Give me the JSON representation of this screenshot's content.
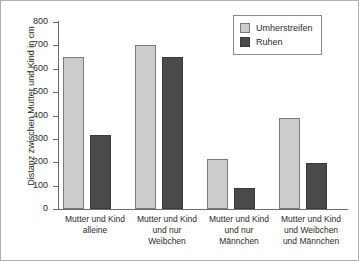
{
  "chart_data": {
    "type": "bar",
    "title": "",
    "subtitle": "",
    "xlabel": "",
    "ylabel": "Distanz zwischen Mutter und Kind in cm",
    "ylim": [
      0,
      800
    ],
    "ytick_step": 100,
    "yticks": [
      800,
      700,
      600,
      500,
      400,
      300,
      200,
      100,
      0
    ],
    "ytick_labels": [
      "800",
      "700",
      "600",
      "500",
      "400",
      "300",
      "200",
      "100",
      "0"
    ],
    "grid": false,
    "legend_position": "top-right",
    "categories": [
      "Mutter und Kind alleine",
      "Mutter und Kind und nur Weibchen",
      "Mutter und Kind und nur Männchen",
      "Mutter und Kind und Weibchen und Männchen"
    ],
    "category_lines": [
      [
        "Mutter und Kind",
        "alleine"
      ],
      [
        "Mutter und Kind",
        "und nur",
        "Weibchen"
      ],
      [
        "Mutter und Kind",
        "und nur",
        "Männchen"
      ],
      [
        "Mutter und Kind",
        "und Weibchen",
        "und Männchen"
      ]
    ],
    "series": [
      {
        "name": "Umherstreifen",
        "color": "#cccccc",
        "values": [
          650,
          700,
          213,
          388
        ]
      },
      {
        "name": "Ruhen",
        "color": "#4a4a4a",
        "values": [
          315,
          650,
          88,
          195
        ]
      }
    ]
  },
  "legend": {
    "entries": [
      {
        "label": "Umherstreifen",
        "color": "#cccccc"
      },
      {
        "label": "Ruhen",
        "color": "#4a4a4a"
      }
    ]
  },
  "axes": {
    "y_title": "Distanz zwischen Mutter und Kind in cm"
  }
}
